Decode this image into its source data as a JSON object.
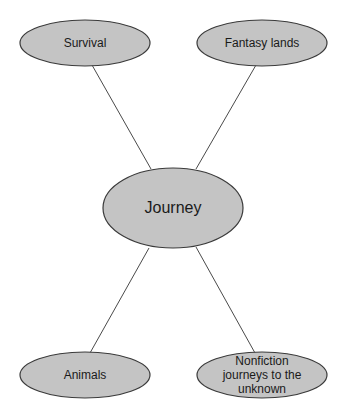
{
  "diagram": {
    "type": "concept-web",
    "colors": {
      "node_fill": "#c4c4c4",
      "node_stroke": "#3a3a3a",
      "connector": "#4a4a4a",
      "background": "#ffffff",
      "text": "#1a1a1a"
    },
    "center": {
      "label": "Journey"
    },
    "nodes": [
      {
        "id": "survival",
        "label": "Survival"
      },
      {
        "id": "fantasy-lands",
        "label": "Fantasy lands"
      },
      {
        "id": "animals",
        "label": "Animals"
      },
      {
        "id": "nonfiction",
        "label": "Nonfiction journeys to the unknown"
      }
    ],
    "edges": [
      {
        "from": "Journey",
        "to": "Survival"
      },
      {
        "from": "Journey",
        "to": "Fantasy lands"
      },
      {
        "from": "Journey",
        "to": "Animals"
      },
      {
        "from": "Journey",
        "to": "Nonfiction journeys to the unknown"
      }
    ]
  }
}
